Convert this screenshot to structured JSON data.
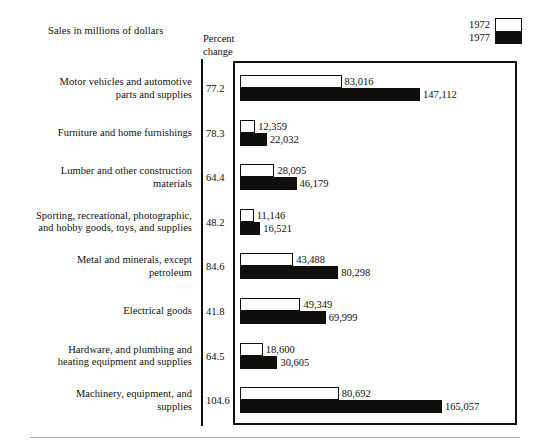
{
  "header": {
    "title": "Sales in millions of dollars",
    "percent_axis_title_line1": "Percent",
    "percent_axis_title_line2": "change"
  },
  "legend": {
    "items": [
      {
        "label": "1972",
        "swatch": "white-open-bar",
        "color": "#ffffff"
      },
      {
        "label": "1977",
        "swatch": "black-filled-bar",
        "color": "#100f0d"
      }
    ]
  },
  "chart_data": {
    "type": "bar",
    "orientation": "horizontal",
    "title": "Sales in millions of dollars",
    "xlabel": "",
    "ylabel": "",
    "grid": false,
    "legend_position": "top-right",
    "categories": [
      "Motor vehicles and automotive parts and supplies",
      "Furniture and home furnishings",
      "Lumber and other construction materials",
      "Sporting, recreational, photographic, and hobby goods, toys, and supplies",
      "Metal and minerals, except petroleum",
      "Electrical goods",
      "Hardware, and plumbing and heating equipment and supplies",
      "Machinery, equipment, and supplies"
    ],
    "series": [
      {
        "name": "1972",
        "values": [
          83016,
          12359,
          28095,
          11146,
          43488,
          49349,
          18600,
          80692
        ]
      },
      {
        "name": "1977",
        "values": [
          147112,
          22032,
          46179,
          16521,
          80298,
          69999,
          30605,
          165057
        ]
      }
    ],
    "percent_change": [
      77.2,
      78.3,
      64.4,
      48.2,
      84.6,
      41.8,
      64.5,
      104.6
    ],
    "xlim": [
      0,
      165057
    ]
  },
  "rows": [
    {
      "category_line1": "Motor vehicles and automotive",
      "category_line2": "parts and supplies",
      "percent": "77.2",
      "value_1972": "83,016",
      "value_1977": "147,112"
    },
    {
      "category_line1": "Furniture and home furnishings",
      "category_line2": "",
      "percent": "78.3",
      "value_1972": "12,359",
      "value_1977": "22,032"
    },
    {
      "category_line1": "Lumber and other construction",
      "category_line2": "materials",
      "percent": "64.4",
      "value_1972": "28,095",
      "value_1977": "46,179"
    },
    {
      "category_line1": "Sporting, recreational, photographic,",
      "category_line2": "and hobby goods, toys, and supplies",
      "percent": "48.2",
      "value_1972": "11,146",
      "value_1977": "16,521"
    },
    {
      "category_line1": "Metal and minerals, except",
      "category_line2": "petroleum",
      "percent": "84.6",
      "value_1972": "43,488",
      "value_1977": "80,298"
    },
    {
      "category_line1": "Electrical goods",
      "category_line2": "",
      "percent": "41.8",
      "value_1972": "49,349",
      "value_1977": "69,999"
    },
    {
      "category_line1": "Hardware, and plumbing and",
      "category_line2": "heating equipment and supplies",
      "percent": "64.5",
      "value_1972": "18,600",
      "value_1977": "30,605"
    },
    {
      "category_line1": "Machinery, equipment, and",
      "category_line2": "supplies",
      "percent": "104.6",
      "value_1972": "80,692",
      "value_1977": "165,057"
    }
  ]
}
